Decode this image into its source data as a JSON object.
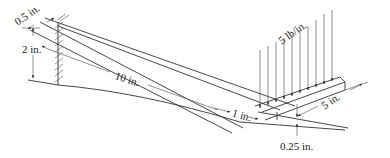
{
  "figure": {
    "dimensions": {
      "width_top": "0.5 in.",
      "height_root": "2 in.",
      "length_taper": "10 in.",
      "transition": "1 in.",
      "length_loaded": "5 in.",
      "thickness_end": "0.25 in."
    },
    "load": {
      "label": "5 lb/in.",
      "arrow_count": 10
    },
    "colors": {
      "line": "#333333",
      "background": "#ffffff"
    }
  }
}
